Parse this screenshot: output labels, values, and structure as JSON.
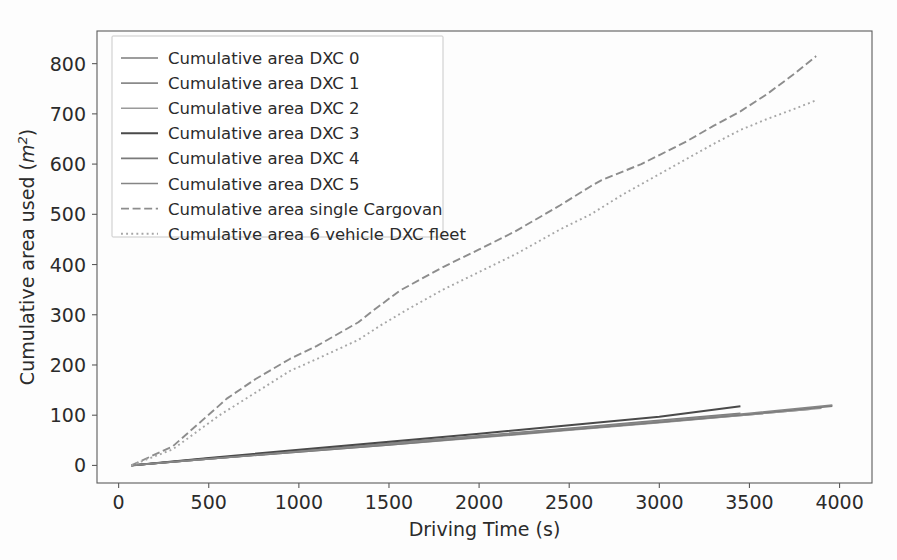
{
  "figure": {
    "background_color": "#fdfdfd",
    "frame_color": "#5b5b5b"
  },
  "axes": {
    "x_label": "Driving Time (s)",
    "y_label_prefix": "Cumulative area used (",
    "y_label_italic": "m",
    "y_label_sup": "2",
    "y_label_suffix": ")",
    "x_ticks": [
      "0",
      "500",
      "1000",
      "1500",
      "2000",
      "2500",
      "3000",
      "3500",
      "4000"
    ],
    "y_ticks": [
      "0",
      "100",
      "200",
      "300",
      "400",
      "500",
      "600",
      "700",
      "800"
    ]
  },
  "legend": {
    "items": [
      {
        "label": "Cumulative area DXC 0",
        "style": "solid",
        "color": "#7d7d7d"
      },
      {
        "label": "Cumulative area DXC 1",
        "style": "solid",
        "color": "#8a8a8a"
      },
      {
        "label": "Cumulative area DXC 2",
        "style": "solid",
        "color": "#9a9a9a"
      },
      {
        "label": "Cumulative area DXC 3",
        "style": "solid",
        "color": "#4a4a4a"
      },
      {
        "label": "Cumulative area DXC 4",
        "style": "solid",
        "color": "#7a7a7a"
      },
      {
        "label": "Cumulative area DXC 5",
        "style": "solid",
        "color": "#858585"
      },
      {
        "label": "Cumulative area single Cargovan",
        "style": "dashed",
        "color": "#8d8d8d"
      },
      {
        "label": "Cumulative area 6 vehicle DXC fleet",
        "style": "dotted",
        "color": "#a6a6a6"
      }
    ]
  },
  "chart_data": {
    "type": "line",
    "title": "",
    "xlabel": "Driving Time (s)",
    "ylabel": "Cumulative area used (m^2)",
    "xlim": [
      -120,
      4180
    ],
    "ylim": [
      -35,
      865
    ],
    "grid": false,
    "legend_position": "upper-left",
    "series": [
      {
        "name": "Cumulative area DXC 0",
        "style": "solid",
        "color": "#7d7d7d",
        "x": [
          70,
          500,
          1000,
          1500,
          2000,
          2500,
          3000,
          3450
        ],
        "y": [
          0,
          14,
          29,
          44,
          59,
          74,
          90,
          104
        ]
      },
      {
        "name": "Cumulative area DXC 1",
        "style": "solid",
        "color": "#8a8a8a",
        "x": [
          70,
          500,
          1000,
          1500,
          2000,
          2500,
          3000,
          3500,
          3840
        ],
        "y": [
          0,
          13,
          28,
          42,
          57,
          71,
          86,
          101,
          112
        ]
      },
      {
        "name": "Cumulative area DXC 2",
        "style": "solid",
        "color": "#9a9a9a",
        "x": [
          70,
          500,
          1000,
          1500,
          2000,
          2500,
          3000,
          3500,
          3900
        ],
        "y": [
          0,
          13,
          27,
          41,
          55,
          70,
          85,
          101,
          114
        ]
      },
      {
        "name": "Cumulative area DXC 3",
        "style": "solid",
        "color": "#4a4a4a",
        "x": [
          70,
          500,
          1000,
          1500,
          2000,
          2500,
          3000,
          3450
        ],
        "y": [
          0,
          15,
          31,
          47,
          63,
          80,
          97,
          118
        ]
      },
      {
        "name": "Cumulative area DXC 4",
        "style": "solid",
        "color": "#7a7a7a",
        "x": [
          70,
          500,
          1000,
          1500,
          2000,
          2500,
          3000,
          3500,
          3960
        ],
        "y": [
          0,
          13,
          27,
          41,
          56,
          71,
          86,
          102,
          118
        ]
      },
      {
        "name": "Cumulative area DXC 5",
        "style": "solid",
        "color": "#858585",
        "x": [
          70,
          500,
          1000,
          1500,
          2000,
          2500,
          3000,
          3500,
          3960
        ],
        "y": [
          0,
          13,
          28,
          43,
          58,
          73,
          88,
          104,
          120
        ]
      },
      {
        "name": "Cumulative area single Cargovan",
        "style": "dashed",
        "color": "#8d8d8d",
        "x": [
          70,
          300,
          560,
          600,
          760,
          950,
          1100,
          1330,
          1400,
          1560,
          1800,
          2000,
          2200,
          2450,
          2620,
          2680,
          2900,
          3000,
          3150,
          3300,
          3450,
          3600,
          3750,
          3870
        ],
        "y": [
          0,
          38,
          120,
          133,
          172,
          212,
          238,
          285,
          305,
          348,
          395,
          430,
          466,
          518,
          556,
          568,
          600,
          618,
          645,
          676,
          705,
          740,
          780,
          815
        ]
      },
      {
        "name": "Cumulative area 6 vehicle DXC fleet",
        "style": "dotted",
        "color": "#a6a6a6",
        "x": [
          70,
          300,
          560,
          760,
          950,
          1100,
          1330,
          1450,
          1600,
          1800,
          2000,
          2200,
          2450,
          2620,
          2800,
          3000,
          3150,
          3300,
          3450,
          3600,
          3750,
          3870
        ],
        "y": [
          0,
          32,
          100,
          145,
          188,
          212,
          250,
          278,
          310,
          350,
          385,
          420,
          470,
          500,
          540,
          580,
          610,
          640,
          668,
          690,
          710,
          727
        ]
      }
    ]
  }
}
